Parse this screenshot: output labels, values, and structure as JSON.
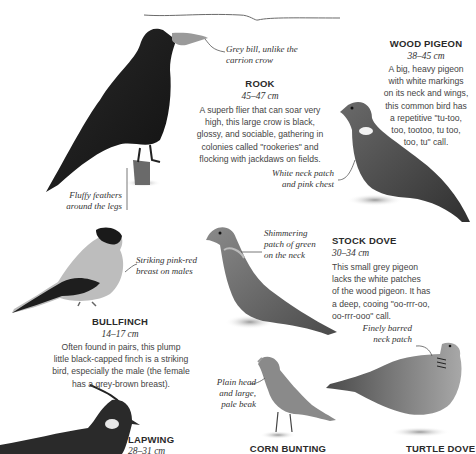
{
  "birds": {
    "rook": {
      "name": "ROOK",
      "size": "45–47 cm",
      "description_lines": [
        "A superb flier that can soar very",
        "high, this large crow is black,",
        "glossy, and sociable, gathering in",
        "colonies called \"rookeries\" and",
        "flocking with jackdaws on fields."
      ],
      "notes": {
        "bill_lines": [
          "Grey bill, unlike the",
          "carrion crow"
        ],
        "legs_lines": [
          "Fluffy feathers",
          "around the legs"
        ]
      }
    },
    "wood_pigeon": {
      "name": "WOOD PIGEON",
      "size": "38–45 cm",
      "description_lines": [
        "A big, heavy pigeon",
        "with white markings",
        "on its neck and wings,",
        "this common bird has",
        "a repetitive \"tu-too,",
        "too, tootoo, tu too,",
        "too, tu\" call."
      ],
      "notes": {
        "neck_lines": [
          "White neck patch",
          "and pink chest"
        ]
      }
    },
    "bullfinch": {
      "name": "BULLFINCH",
      "size": "14–17 cm",
      "description_lines": [
        "Often found in pairs, this plump",
        "little black-capped finch is a striking",
        "bird, especially the male (the female",
        "has a grey-brown breast)."
      ],
      "notes": {
        "breast_lines": [
          "Striking pink-red",
          "breast on males"
        ]
      }
    },
    "stock_dove": {
      "name": "STOCK DOVE",
      "size": "30–34 cm",
      "description_lines": [
        "This small grey pigeon",
        "lacks the white patches",
        "of the wood pigeon. It has",
        "a deep, cooing \"oo-rrr-oo,",
        "oo-rrr-ooo\" call."
      ],
      "notes": {
        "neck_lines": [
          "Shimmering",
          "patch of green",
          "on the neck"
        ]
      }
    },
    "lapwing": {
      "name": "LAPWING",
      "size": "28–31 cm"
    },
    "corn_bunting": {
      "name": "CORN BUNTING",
      "notes": {
        "head_lines": [
          "Plain head",
          "and large,",
          "pale beak"
        ]
      }
    },
    "turtle_dove": {
      "name": "TURTLE DOVE",
      "notes": {
        "neck_lines": [
          "Finely barred",
          "neck patch"
        ]
      }
    }
  },
  "colors": {
    "text_dark": "#2a2a2a",
    "text_body": "#444444",
    "leader_line": "#555555",
    "bird_black": "#1c1c1c",
    "bird_grey": "#6e6e6e"
  }
}
